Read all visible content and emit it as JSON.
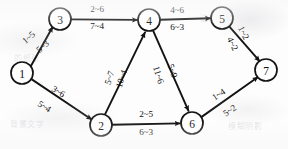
{
  "diagram": {
    "type": "directed-graph",
    "node_radius": 11,
    "nodes": [
      {
        "id": "1",
        "label": "1",
        "x": 22,
        "y": 73
      },
      {
        "id": "2",
        "label": "2",
        "x": 101,
        "y": 125
      },
      {
        "id": "3",
        "label": "3",
        "x": 60,
        "y": 19
      },
      {
        "id": "4",
        "label": "4",
        "x": 149,
        "y": 20
      },
      {
        "id": "5",
        "label": "5",
        "x": 222,
        "y": 18
      },
      {
        "id": "6",
        "label": "6",
        "x": 192,
        "y": 123
      },
      {
        "id": "7",
        "label": "7",
        "x": 266,
        "y": 70
      }
    ],
    "edges": [
      {
        "id": "edge-1-3",
        "from": "1",
        "to": "3",
        "label_top": "1~5",
        "label_bottom": "5~3",
        "top_pos": {
          "x": 29,
          "y": 38,
          "rot": -41
        },
        "bottom_pos": {
          "x": 43,
          "y": 47,
          "rot": -41
        }
      },
      {
        "id": "edge-1-2",
        "from": "1",
        "to": "2",
        "label_top": "3~6",
        "label_bottom": "5~4",
        "top_pos": {
          "x": 58,
          "y": 92,
          "rot": 32
        },
        "bottom_pos": {
          "x": 44,
          "y": 107,
          "rot": 32
        }
      },
      {
        "id": "edge-3-4",
        "from": "3",
        "to": "4",
        "label_top": "2~6",
        "label_bottom": "7~4",
        "top_pos": {
          "x": 97,
          "y": 10,
          "rot": 0
        },
        "bottom_pos": {
          "x": 97,
          "y": 27,
          "rot": 0
        }
      },
      {
        "id": "edge-4-5",
        "from": "4",
        "to": "5",
        "label_top": "4~6",
        "label_bottom": "6~3",
        "top_pos": {
          "x": 177,
          "y": 11,
          "rot": 0
        },
        "bottom_pos": {
          "x": 177,
          "y": 28,
          "rot": 0
        }
      },
      {
        "id": "edge-5-7",
        "from": "5",
        "to": "7",
        "label_top": "1~2",
        "label_bottom": "4~2",
        "top_pos": {
          "x": 243,
          "y": 33,
          "rot": 63
        },
        "bottom_pos": {
          "x": 232,
          "y": 44,
          "rot": 63
        }
      },
      {
        "id": "edge-2-4",
        "from": "2",
        "to": "4",
        "label_top": "5~7",
        "label_bottom": "10~4",
        "top_pos": {
          "x": 110,
          "y": 78,
          "rot": -72
        },
        "bottom_pos": {
          "x": 122,
          "y": 79,
          "rot": -72
        }
      },
      {
        "id": "edge-4-6",
        "from": "4",
        "to": "6",
        "label_top": "11~6",
        "label_bottom": "5~9",
        "top_pos": {
          "x": 158,
          "y": 75,
          "rot": 72
        },
        "bottom_pos": {
          "x": 172,
          "y": 71,
          "rot": 72
        }
      },
      {
        "id": "edge-2-6",
        "from": "2",
        "to": "6",
        "label_top": "2~5",
        "label_bottom": "6~3",
        "top_pos": {
          "x": 146,
          "y": 115,
          "rot": 0
        },
        "bottom_pos": {
          "x": 146,
          "y": 133,
          "rot": 0
        }
      },
      {
        "id": "edge-6-7",
        "from": "6",
        "to": "7",
        "label_top": "1~4",
        "label_bottom": "5~2",
        "top_pos": {
          "x": 219,
          "y": 95,
          "rot": -34
        },
        "bottom_pos": {
          "x": 230,
          "y": 111,
          "rot": -34
        }
      }
    ],
    "background_marks": [
      {
        "text": "这是扫描",
        "x": 200,
        "y": 12
      },
      {
        "text": "的纸张",
        "x": 14,
        "y": 52
      },
      {
        "text": "背景文字",
        "x": 10,
        "y": 118
      },
      {
        "text": "模糊阴影",
        "x": 228,
        "y": 120
      }
    ]
  }
}
